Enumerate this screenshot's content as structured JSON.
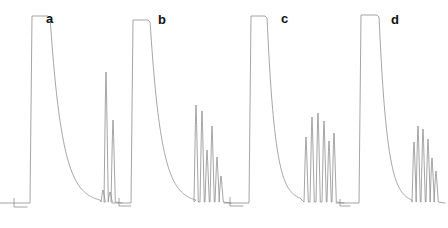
{
  "figure": {
    "type": "multi-panel-chromatogram",
    "panel_count": 4,
    "background_color": "#ffffff",
    "trace_color": "#8e8e8e",
    "label_color": "#111111"
  },
  "panels": [
    {
      "label": "a",
      "label_x": 46,
      "label_y": 12,
      "origin_x": 0,
      "baseline_y": 203,
      "axis_mark": {
        "x": 14,
        "y": 198,
        "arm": 9
      },
      "solvent_peak": {
        "start_x": 30,
        "rise_x": 32,
        "top_y": 16,
        "end_x": 48,
        "fall_x": 50
      },
      "tail": {
        "decay_from_x": 50,
        "decay_to_x": 100,
        "start_y": 16,
        "end_y": 200,
        "shape": "exponential"
      },
      "peaks": [
        {
          "x": 50,
          "top_y": 58,
          "half_width": 1.1
        },
        {
          "x": 62,
          "top_y": 170,
          "half_width": 1.2
        },
        {
          "x": 68,
          "top_y": 84,
          "half_width": 1.1
        },
        {
          "x": 74,
          "top_y": 176,
          "half_width": 1.0
        },
        {
          "x": 78,
          "top_y": 181,
          "half_width": 1.0
        },
        {
          "x": 82,
          "top_y": 52,
          "half_width": 1.1
        },
        {
          "x": 86,
          "top_y": 186,
          "half_width": 1.0
        },
        {
          "x": 89,
          "top_y": 66,
          "half_width": 1.0
        },
        {
          "x": 93,
          "top_y": 49,
          "half_width": 1.1
        },
        {
          "x": 96,
          "top_y": 188,
          "half_width": 1.0
        },
        {
          "x": 99,
          "top_y": 60,
          "half_width": 1.0
        },
        {
          "x": 103,
          "top_y": 190,
          "half_width": 1.0
        },
        {
          "x": 106,
          "top_y": 72,
          "half_width": 1.0
        },
        {
          "x": 110,
          "top_y": 192,
          "half_width": 1.0
        },
        {
          "x": 113,
          "top_y": 120,
          "half_width": 1.0
        }
      ],
      "trace_end_x": 122
    },
    {
      "label": "b",
      "label_x": 158,
      "label_y": 13,
      "origin_x": 112,
      "baseline_y": 203,
      "axis_mark": {
        "x": 119,
        "y": 198,
        "arm": 8
      },
      "solvent_peak": {
        "start_x": 131,
        "rise_x": 133,
        "top_y": 20,
        "end_x": 148,
        "fall_x": 150
      },
      "tail": {
        "decay_from_x": 150,
        "decay_to_x": 196,
        "start_y": 20,
        "end_y": 200,
        "shape": "exponential"
      },
      "peaks": [
        {
          "x": 150,
          "top_y": 70,
          "half_width": 1.1
        },
        {
          "x": 167,
          "top_y": 119,
          "half_width": 1.1
        },
        {
          "x": 178,
          "top_y": 83,
          "half_width": 1.1
        },
        {
          "x": 189,
          "top_y": 147,
          "half_width": 1.0
        },
        {
          "x": 196,
          "top_y": 105,
          "half_width": 1.0
        },
        {
          "x": 202,
          "top_y": 111,
          "half_width": 1.0
        },
        {
          "x": 207,
          "top_y": 150,
          "half_width": 1.0
        },
        {
          "x": 212,
          "top_y": 126,
          "half_width": 1.0
        },
        {
          "x": 217,
          "top_y": 157,
          "half_width": 1.0
        },
        {
          "x": 221,
          "top_y": 176,
          "half_width": 1.0
        }
      ],
      "trace_end_x": 231
    },
    {
      "label": "c",
      "label_x": 281,
      "label_y": 12,
      "origin_x": 224,
      "baseline_y": 203,
      "axis_mark": {
        "x": 230,
        "y": 197,
        "arm": 9
      },
      "solvent_peak": {
        "start_x": 249,
        "rise_x": 251,
        "top_y": 16,
        "end_x": 265,
        "fall_x": 267
      },
      "tail": {
        "decay_from_x": 267,
        "decay_to_x": 300,
        "start_y": 16,
        "end_y": 198,
        "shape": "exponential"
      },
      "peaks": [
        {
          "x": 267,
          "top_y": 40,
          "half_width": 1.1
        },
        {
          "x": 276,
          "top_y": 18,
          "half_width": 1.2
        },
        {
          "x": 288,
          "top_y": 105,
          "half_width": 1.1
        },
        {
          "x": 297,
          "top_y": 87,
          "half_width": 1.1
        },
        {
          "x": 306,
          "top_y": 137,
          "half_width": 1.0
        },
        {
          "x": 312,
          "top_y": 117,
          "half_width": 1.0
        },
        {
          "x": 318,
          "top_y": 113,
          "half_width": 1.0
        },
        {
          "x": 324,
          "top_y": 121,
          "half_width": 1.0
        },
        {
          "x": 329,
          "top_y": 141,
          "half_width": 1.0
        },
        {
          "x": 334,
          "top_y": 133,
          "half_width": 1.0
        }
      ],
      "trace_end_x": 344
    },
    {
      "label": "d",
      "label_x": 391,
      "label_y": 13,
      "origin_x": 336,
      "baseline_y": 203,
      "axis_mark": {
        "x": 340,
        "y": 199,
        "arm": 7
      },
      "solvent_peak": {
        "start_x": 359,
        "rise_x": 361,
        "top_y": 15,
        "end_x": 377,
        "fall_x": 379
      },
      "tail": {
        "decay_from_x": 379,
        "decay_to_x": 412,
        "start_y": 15,
        "end_y": 200,
        "shape": "exponential"
      },
      "peaks": [
        {
          "x": 379,
          "top_y": 60,
          "half_width": 1.1
        },
        {
          "x": 392,
          "top_y": 150,
          "half_width": 1.1
        },
        {
          "x": 403,
          "top_y": 122,
          "half_width": 1.1
        },
        {
          "x": 410,
          "top_y": 161,
          "half_width": 1.0
        },
        {
          "x": 414,
          "top_y": 142,
          "half_width": 1.0
        },
        {
          "x": 418,
          "top_y": 126,
          "half_width": 1.0
        },
        {
          "x": 423,
          "top_y": 129,
          "half_width": 1.0
        },
        {
          "x": 428,
          "top_y": 139,
          "half_width": 1.0
        },
        {
          "x": 432,
          "top_y": 158,
          "half_width": 1.0
        },
        {
          "x": 436,
          "top_y": 171,
          "half_width": 1.0
        }
      ],
      "trace_end_x": 445
    }
  ],
  "chart_data": {
    "type": "line",
    "title": "",
    "subtitle": "",
    "xlabel": "",
    "ylabel": "",
    "grid": false,
    "legend": false,
    "axis_visible": "corner-mark-only",
    "series": [
      {
        "name": "a",
        "solvent_peak_saturated": true,
        "analyte_peak_count": 15,
        "relative_peak_heights": [
          0.78,
          0.18,
          0.64,
          0.15,
          0.12,
          0.81,
          0.09,
          0.73,
          0.83,
          0.08,
          0.77,
          0.07,
          0.7,
          0.06,
          0.45
        ]
      },
      {
        "name": "b",
        "solvent_peak_saturated": true,
        "analyte_peak_count": 10,
        "relative_peak_heights": [
          0.73,
          0.46,
          0.66,
          0.31,
          0.54,
          0.51,
          0.29,
          0.42,
          0.25,
          0.15
        ]
      },
      {
        "name": "c",
        "solvent_peak_saturated": true,
        "analyte_peak_count": 10,
        "relative_peak_heights": [
          0.88,
          0.99,
          0.53,
          0.62,
          0.36,
          0.46,
          0.48,
          0.44,
          0.33,
          0.38
        ]
      },
      {
        "name": "d",
        "solvent_peak_saturated": true,
        "analyte_peak_count": 10,
        "relative_peak_heights": [
          0.77,
          0.29,
          0.44,
          0.23,
          0.33,
          0.42,
          0.4,
          0.35,
          0.25,
          0.18
        ]
      }
    ]
  }
}
